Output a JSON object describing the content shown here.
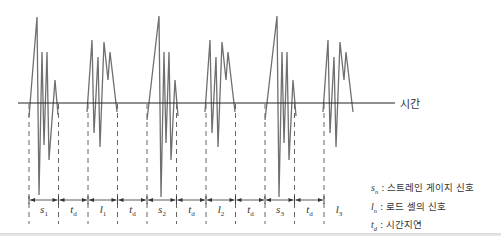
{
  "diagram": {
    "axis_label": "시간",
    "colors": {
      "waveform": "#6f6f6f",
      "axis": "#222222",
      "dashed_boundary": "#555555",
      "text": "#333333"
    },
    "segments": [
      {
        "symbol": "s",
        "subscript": "1",
        "type": "strain_gauge"
      },
      {
        "symbol": "t",
        "subscript": "d",
        "type": "delay"
      },
      {
        "symbol": "l",
        "subscript": "1",
        "type": "load_cell"
      },
      {
        "symbol": "t",
        "subscript": "d",
        "type": "delay"
      },
      {
        "symbol": "s",
        "subscript": "2",
        "type": "strain_gauge"
      },
      {
        "symbol": "t",
        "subscript": "d",
        "type": "delay"
      },
      {
        "symbol": "l",
        "subscript": "2",
        "type": "load_cell"
      },
      {
        "symbol": "t",
        "subscript": "d",
        "type": "delay"
      },
      {
        "symbol": "s",
        "subscript": "3",
        "type": "strain_gauge"
      },
      {
        "symbol": "t",
        "subscript": "d",
        "type": "delay"
      },
      {
        "symbol": "l",
        "subscript": "3",
        "type": "load_cell"
      }
    ],
    "legend": [
      {
        "symbol": "s",
        "subscript": "n",
        "text": " : 스트레인 게이지 신호"
      },
      {
        "symbol": "l",
        "subscript": "n",
        "text": " : 로드 셀의 신호"
      },
      {
        "symbol": "t",
        "subscript": "d",
        "text": " : 시간지연"
      }
    ]
  }
}
